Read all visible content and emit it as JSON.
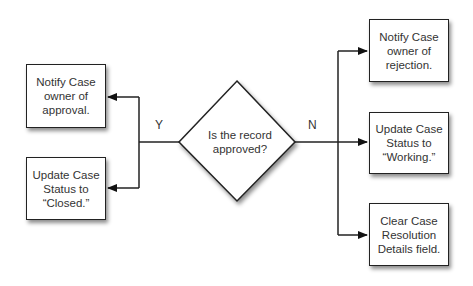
{
  "decision": {
    "text": "Is the record approved?"
  },
  "branches": {
    "yes": {
      "label": "Y",
      "actions": [
        "Notify Case owner of approval.",
        "Update Case Status to “Closed.”"
      ]
    },
    "no": {
      "label": "N",
      "actions": [
        "Notify Case owner of rejection.",
        "Update Case Status to “Working.”",
        "Clear Case Resolution Details field."
      ]
    }
  }
}
